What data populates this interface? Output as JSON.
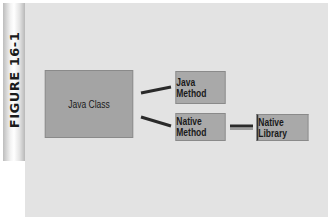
{
  "figure": {
    "label": "FIGURE 16-1"
  },
  "diagram": {
    "nodes": [
      {
        "id": "java_class",
        "label": "Java Class"
      },
      {
        "id": "java_method",
        "label": "Java Method"
      },
      {
        "id": "native_method",
        "label": "Native Method"
      },
      {
        "id": "native_library",
        "label": "Native Library"
      }
    ],
    "edges": [
      {
        "from": "java_class",
        "to": "java_method"
      },
      {
        "from": "java_class",
        "to": "native_method"
      },
      {
        "from": "native_method",
        "to": "native_library"
      }
    ]
  },
  "colors": {
    "panel": "#e3e3e3",
    "box": "#a9a9a9",
    "connector": "#2a2a2a"
  }
}
